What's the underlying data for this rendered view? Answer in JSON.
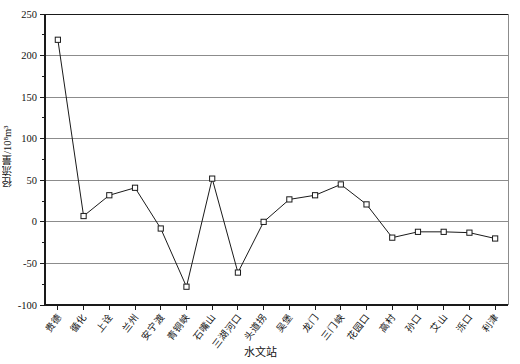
{
  "chart_data": {
    "type": "line",
    "title": "",
    "xlabel": "水文站",
    "ylabel": "径流量/10⁸m³",
    "ylim": [
      -100,
      250
    ],
    "ytick_values": [
      -100,
      -50,
      0,
      50,
      100,
      150,
      200,
      250
    ],
    "ytick_labels": [
      "-100",
      "-50",
      "0",
      "50",
      "100",
      "150",
      "200",
      "250"
    ],
    "grid": "horizontal",
    "legend": "none",
    "marker": "open-square",
    "line_color": "#1a1a1a",
    "grid_color": "#8c8c8c",
    "axis_color": "#1a1a1a",
    "categories": [
      "贵德",
      "循化",
      "上诠",
      "兰州",
      "安宁渡",
      "青铜峡",
      "石嘴山",
      "三湖河口",
      "头道拐",
      "吴堡",
      "龙门",
      "三门峡",
      "花园口",
      "高村",
      "孙口",
      "艾山",
      "泺口",
      "利津"
    ],
    "values": [
      219,
      7,
      32,
      41,
      -8,
      -78,
      52,
      -61,
      0,
      27,
      32,
      45,
      21,
      -19,
      -12,
      -12,
      -13,
      -20
    ],
    "series": [
      {
        "name": "径流量",
        "values": [
          219,
          7,
          32,
          41,
          -8,
          -78,
          52,
          -61,
          0,
          27,
          32,
          45,
          21,
          -19,
          -12,
          -12,
          -13,
          -20
        ]
      }
    ]
  }
}
